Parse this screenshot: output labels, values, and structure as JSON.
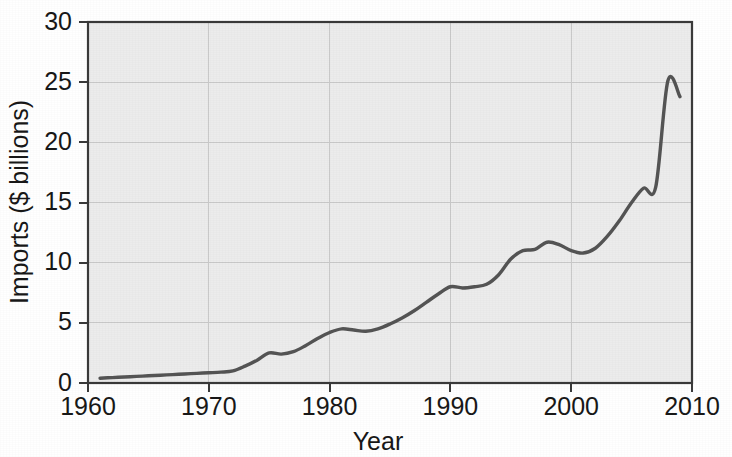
{
  "figure": {
    "background_color": "#ffffff",
    "plot_background_color": "#ececec",
    "grid_color": "#c9c9c9",
    "frame_color": "#3a3a3a",
    "line_color": "#545454"
  },
  "chart_data": {
    "type": "line",
    "title": "",
    "subtitle": "",
    "xlabel": "Year",
    "ylabel": "Imports ($ billions)",
    "xlim": [
      1960,
      2010
    ],
    "ylim": [
      0,
      30
    ],
    "xticks": [
      1960,
      1970,
      1980,
      1990,
      2000,
      2010
    ],
    "xtick_labels": [
      "1960",
      "1970",
      "1980",
      "1990",
      "2000",
      "2010"
    ],
    "yticks": [
      0,
      5,
      10,
      15,
      20,
      25,
      30
    ],
    "ytick_labels": [
      "0",
      "5",
      "10",
      "15",
      "20",
      "25",
      "30"
    ],
    "grid": true,
    "grid_axis": "both",
    "legend": false,
    "legend_position": "none",
    "annotations": [],
    "series": [
      {
        "name": "Imports",
        "units": "$ billions",
        "x": [
          1961,
          1962,
          1963,
          1964,
          1965,
          1966,
          1967,
          1968,
          1969,
          1970,
          1971,
          1972,
          1973,
          1974,
          1975,
          1976,
          1977,
          1978,
          1979,
          1980,
          1981,
          1982,
          1983,
          1984,
          1985,
          1986,
          1987,
          1988,
          1989,
          1990,
          1991,
          1992,
          1993,
          1994,
          1995,
          1996,
          1997,
          1998,
          1999,
          2000,
          2001,
          2002,
          2003,
          2004,
          2005,
          2006,
          2007,
          2008,
          2009
        ],
        "values": [
          0.4,
          0.45,
          0.5,
          0.55,
          0.6,
          0.65,
          0.7,
          0.75,
          0.8,
          0.85,
          0.9,
          1.0,
          1.4,
          1.9,
          2.5,
          2.4,
          2.6,
          3.1,
          3.7,
          4.2,
          4.5,
          4.4,
          4.3,
          4.5,
          4.9,
          5.4,
          6.0,
          6.7,
          7.4,
          8.0,
          7.9,
          8.0,
          8.2,
          9.0,
          10.3,
          11.0,
          11.1,
          11.7,
          11.5,
          11.0,
          10.8,
          11.2,
          12.2,
          13.5,
          15.0,
          16.2,
          16.3,
          25.1,
          23.8
        ]
      }
    ]
  },
  "axes": {
    "y_axis_title": "Imports ($ billions)",
    "x_axis_title": "Year"
  }
}
